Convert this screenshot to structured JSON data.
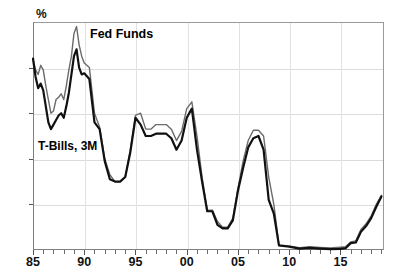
{
  "chart_data": {
    "type": "line",
    "title": "",
    "xlabel": "",
    "ylabel": "%",
    "unit_label": "%",
    "ylim": [
      0,
      10
    ],
    "xlim": [
      1985,
      2019.25
    ],
    "grid": true,
    "legend_position": "inline-annotations",
    "yticks": [
      0,
      2,
      4,
      6,
      8,
      10
    ],
    "ytick_labels": [
      "0",
      "2",
      "4",
      "6",
      "8",
      "10"
    ],
    "xticks": [
      1985,
      1990,
      1995,
      2000,
      2005,
      2010,
      2015
    ],
    "xtick_labels": [
      "85",
      "90",
      "95",
      "00",
      "05",
      "10",
      "15"
    ],
    "xtick_minor_step": 1,
    "annotations": [
      {
        "text": "Fed Funds",
        "x": 1990.6,
        "y": 9.1
      },
      {
        "text": "T-Bills, 3M",
        "x": 1985.6,
        "y": 4.8
      }
    ],
    "series": [
      {
        "name": "Fed Funds",
        "color": "#6b6b6b",
        "width": 1.4,
        "x": [
          1985.0,
          1985.25,
          1985.5,
          1985.75,
          1986.0,
          1986.25,
          1986.5,
          1986.75,
          1987.0,
          1987.25,
          1987.5,
          1987.75,
          1988.0,
          1988.25,
          1988.5,
          1988.75,
          1989.0,
          1989.25,
          1989.5,
          1989.75,
          1990.0,
          1990.5,
          1991.0,
          1991.5,
          1992.0,
          1992.5,
          1993.0,
          1993.5,
          1994.0,
          1994.5,
          1995.0,
          1995.5,
          1996.0,
          1996.5,
          1997.0,
          1997.5,
          1998.0,
          1998.5,
          1999.0,
          1999.5,
          2000.0,
          2000.5,
          2001.0,
          2001.5,
          2002.0,
          2002.5,
          2003.0,
          2003.5,
          2004.0,
          2004.5,
          2005.0,
          2005.5,
          2006.0,
          2006.5,
          2007.0,
          2007.5,
          2008.0,
          2008.5,
          2009.0,
          2010.0,
          2011.0,
          2012.0,
          2013.0,
          2014.0,
          2015.0,
          2015.5,
          2016.0,
          2016.5,
          2017.0,
          2017.5,
          2018.0,
          2018.5,
          2019.0
        ],
        "y": [
          8.35,
          7.9,
          7.7,
          8.1,
          7.9,
          7.2,
          6.6,
          6.0,
          6.1,
          6.6,
          6.7,
          6.85,
          6.6,
          7.2,
          7.9,
          8.5,
          9.5,
          9.8,
          9.0,
          8.5,
          8.2,
          8.0,
          6.0,
          5.4,
          4.0,
          3.3,
          3.0,
          3.0,
          3.2,
          4.4,
          5.9,
          6.0,
          5.3,
          5.3,
          5.5,
          5.5,
          5.5,
          5.3,
          4.8,
          5.2,
          6.2,
          6.5,
          5.0,
          3.2,
          1.75,
          1.75,
          1.25,
          1.0,
          1.0,
          1.4,
          2.7,
          3.9,
          4.8,
          5.25,
          5.25,
          5.0,
          3.2,
          2.0,
          0.2,
          0.17,
          0.1,
          0.14,
          0.11,
          0.09,
          0.12,
          0.14,
          0.35,
          0.4,
          0.9,
          1.15,
          1.5,
          2.0,
          2.4
        ]
      },
      {
        "name": "T-Bills, 3M",
        "color": "#111111",
        "width": 2.2,
        "x": [
          1985.0,
          1985.25,
          1985.5,
          1985.75,
          1986.0,
          1986.25,
          1986.5,
          1986.75,
          1987.0,
          1987.25,
          1987.5,
          1987.75,
          1988.0,
          1988.25,
          1988.5,
          1988.75,
          1989.0,
          1989.25,
          1989.5,
          1989.75,
          1990.0,
          1990.5,
          1991.0,
          1991.5,
          1992.0,
          1992.5,
          1993.0,
          1993.5,
          1994.0,
          1994.5,
          1995.0,
          1995.5,
          1996.0,
          1996.5,
          1997.0,
          1997.5,
          1998.0,
          1998.5,
          1999.0,
          1999.5,
          2000.0,
          2000.5,
          2001.0,
          2001.5,
          2002.0,
          2002.5,
          2003.0,
          2003.5,
          2004.0,
          2004.5,
          2005.0,
          2005.5,
          2006.0,
          2006.5,
          2007.0,
          2007.5,
          2008.0,
          2008.5,
          2009.0,
          2010.0,
          2011.0,
          2012.0,
          2013.0,
          2014.0,
          2015.0,
          2015.5,
          2016.0,
          2016.5,
          2017.0,
          2017.5,
          2018.0,
          2018.5,
          2019.0
        ],
        "y": [
          8.4,
          7.6,
          7.1,
          7.3,
          7.0,
          6.3,
          5.6,
          5.3,
          5.5,
          5.7,
          5.9,
          6.0,
          5.8,
          6.3,
          6.9,
          7.7,
          8.5,
          8.8,
          8.0,
          7.7,
          7.75,
          7.5,
          5.6,
          5.3,
          3.9,
          3.1,
          3.0,
          3.0,
          3.2,
          4.3,
          5.8,
          5.5,
          5.0,
          5.0,
          5.1,
          5.1,
          5.1,
          4.9,
          4.4,
          4.8,
          5.8,
          6.2,
          4.4,
          3.0,
          1.7,
          1.7,
          1.1,
          0.95,
          0.95,
          1.3,
          2.6,
          3.6,
          4.5,
          4.9,
          5.0,
          4.4,
          2.2,
          1.6,
          0.2,
          0.15,
          0.06,
          0.09,
          0.06,
          0.04,
          0.05,
          0.08,
          0.3,
          0.33,
          0.8,
          1.05,
          1.4,
          1.9,
          2.35
        ]
      }
    ]
  },
  "axis": {
    "unit_label": "%"
  }
}
